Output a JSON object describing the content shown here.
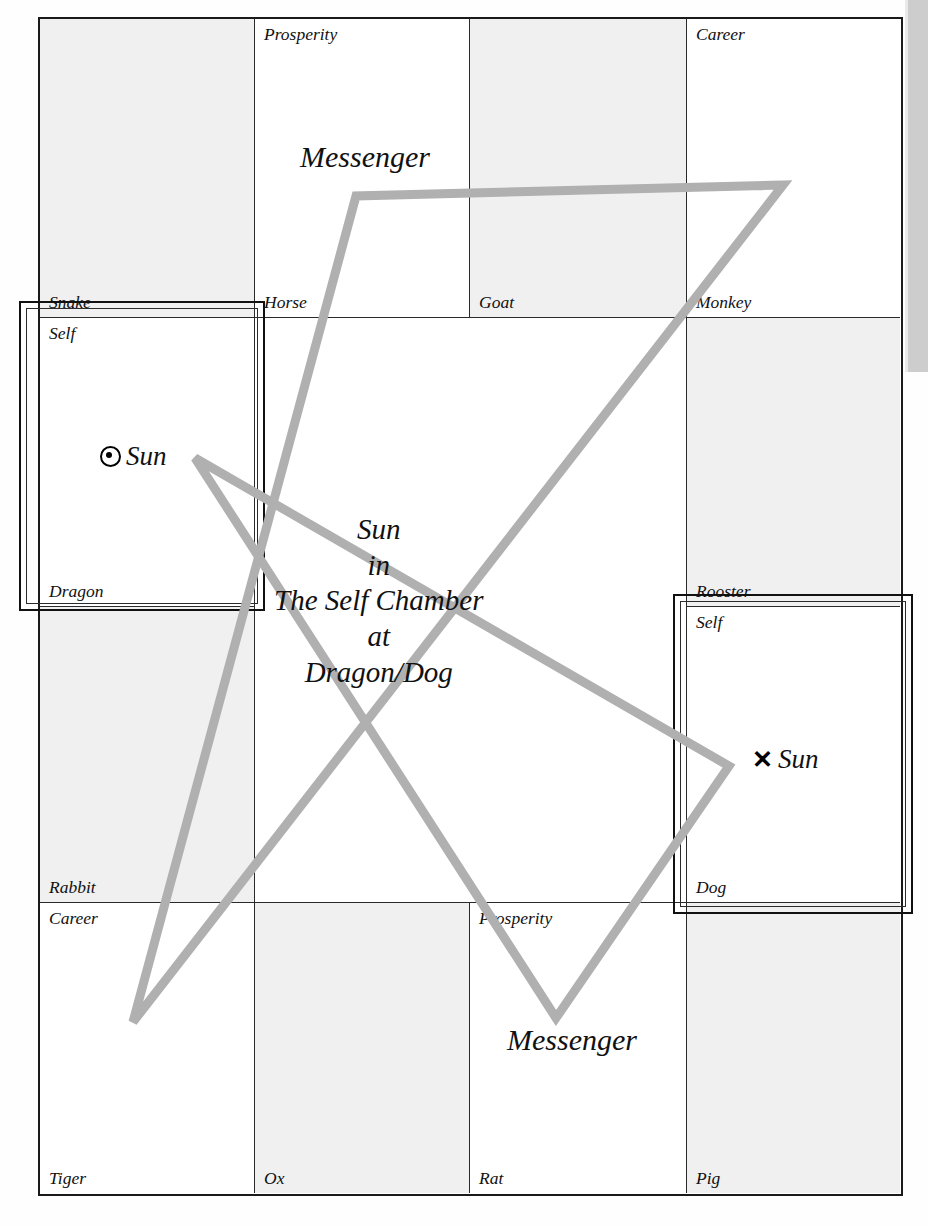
{
  "diagram": {
    "title_block": {
      "line1": "Sun",
      "line2": "in",
      "line3": "The Self Chamber",
      "line4": "at",
      "line5": "Dragon/Dog"
    },
    "colors": {
      "triangle": "#b0b0b0",
      "grid_line": "#2a2a2a",
      "outer_border": "#1a1a1a",
      "cell_shade": "#f0f0f0",
      "text": "#111111"
    },
    "cells": [
      {
        "branch": "Snake",
        "chamber": "",
        "shaded": true,
        "row": 1,
        "col": 1
      },
      {
        "branch": "Horse",
        "chamber": "Prosperity",
        "shaded": false,
        "row": 1,
        "col": 2
      },
      {
        "branch": "Goat",
        "chamber": "",
        "shaded": true,
        "row": 1,
        "col": 3
      },
      {
        "branch": "Monkey",
        "chamber": "Career",
        "shaded": false,
        "row": 1,
        "col": 4
      },
      {
        "branch": "Dragon",
        "chamber": "Self",
        "shaded": false,
        "row": 2,
        "col": 1
      },
      {
        "branch": "Rooster",
        "chamber": "",
        "shaded": true,
        "row": 2,
        "col": 4
      },
      {
        "branch": "Rabbit",
        "chamber": "",
        "shaded": true,
        "row": 3,
        "col": 1
      },
      {
        "branch": "Dog",
        "chamber": "Self",
        "shaded": false,
        "row": 3,
        "col": 4
      },
      {
        "branch": "Tiger",
        "chamber": "Career",
        "shaded": false,
        "row": 4,
        "col": 1
      },
      {
        "branch": "Ox",
        "chamber": "",
        "shaded": true,
        "row": 4,
        "col": 2
      },
      {
        "branch": "Rat",
        "chamber": "Prosperity",
        "shaded": false,
        "row": 4,
        "col": 3
      },
      {
        "branch": "Pig",
        "chamber": "",
        "shaded": true,
        "row": 4,
        "col": 4
      }
    ],
    "markers": [
      {
        "id": "sun-dragon",
        "glyph": "circled-dot",
        "label": "Sun"
      },
      {
        "id": "sun-dog",
        "glyph": "cross",
        "label": "Sun"
      }
    ],
    "annotations": {
      "messenger_top": "Messenger",
      "messenger_bottom": "Messenger"
    }
  }
}
